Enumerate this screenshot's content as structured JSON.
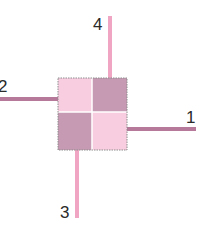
{
  "diagram": {
    "colors": {
      "light_pink": "#f9cde0",
      "mauve": "#c69ab3",
      "arm_mauve": "#b7799a",
      "arm_pink": "#f0a6c2",
      "border": "#8c8c8c",
      "divider": "#ffffff",
      "label": "#2a2a2a"
    },
    "quadrants": [
      {
        "position": "top-left",
        "color": "light_pink"
      },
      {
        "position": "top-right",
        "color": "mauve"
      },
      {
        "position": "bottom-left",
        "color": "mauve"
      },
      {
        "position": "bottom-right",
        "color": "light_pink"
      }
    ],
    "arms": [
      {
        "label": "1",
        "direction": "right",
        "color": "arm_mauve"
      },
      {
        "label": "2",
        "direction": "left",
        "color": "arm_mauve"
      },
      {
        "label": "3",
        "direction": "down",
        "color": "arm_pink"
      },
      {
        "label": "4",
        "direction": "up",
        "color": "arm_pink"
      }
    ]
  }
}
